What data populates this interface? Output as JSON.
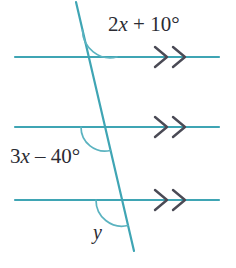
{
  "figure": {
    "background_color": "#ffffff",
    "line_color": "#3fa5b4",
    "arc_color": "#5bb3c0",
    "mark_color": "#4a4a55",
    "text_color": "#2b2b33"
  },
  "labels": {
    "top_angle": "2x + 10°",
    "top_angle_parts": {
      "coefficient": "2",
      "variable": "x",
      "operator": "+",
      "constant": "10°"
    },
    "middle_angle": "3x – 40°",
    "middle_angle_parts": {
      "coefficient": "3",
      "variable": "x",
      "operator": "–",
      "constant": "40°"
    },
    "bottom_angle": "y"
  },
  "geometry": {
    "parallel_lines": [
      {
        "name": "line-top",
        "x1": 15,
        "y1": 57,
        "x2": 219,
        "y2": 57,
        "arrow_marks": 2
      },
      {
        "name": "line-middle",
        "x1": 15,
        "y1": 127,
        "x2": 219,
        "y2": 127,
        "arrow_marks": 2
      },
      {
        "name": "line-bottom",
        "x1": 15,
        "y1": 200,
        "x2": 219,
        "y2": 200,
        "arrow_marks": 2
      }
    ],
    "transversal": {
      "name": "transversal",
      "x1": 76,
      "y1": 2,
      "x2": 134,
      "y2": 251
    },
    "intersections": [
      {
        "name": "intersection-top",
        "x": 89,
        "y": 57
      },
      {
        "name": "intersection-middle",
        "x": 105,
        "y": 127
      },
      {
        "name": "intersection-bottom",
        "x": 122,
        "y": 200
      }
    ],
    "angle_arcs": [
      {
        "name": "arc-top-angle",
        "radius": 28,
        "position": "above-right-of-transversal"
      },
      {
        "name": "arc-middle-angle",
        "radius": 24,
        "position": "below-left-of-transversal"
      },
      {
        "name": "arc-bottom-angle",
        "radius": 26,
        "position": "below-left-of-transversal"
      }
    ],
    "chevron_marks": {
      "count_per_line": 2,
      "x_positions": [
        158,
        178
      ],
      "size": 11
    }
  }
}
